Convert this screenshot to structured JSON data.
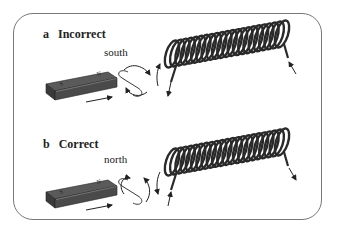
{
  "panels": [
    {
      "letter": "a",
      "title": "Incorrect",
      "pole": "south",
      "coil_arrows": "incorrect"
    },
    {
      "letter": "b",
      "title": "Correct",
      "pole": "north",
      "coil_arrows": "correct"
    }
  ],
  "magnet": {
    "pole_left": "S",
    "pole_right": "N"
  },
  "colors": {
    "magnet_top": "#5a5a5a",
    "magnet_side": "#3a3a3a",
    "coil": "#2a2a2a",
    "frame": "#777777"
  }
}
